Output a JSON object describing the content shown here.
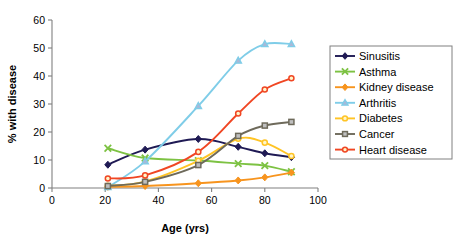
{
  "chart_data": {
    "type": "line",
    "title": "",
    "xlabel": "Age (yrs)",
    "ylabel": "% with disease",
    "xlim": [
      0,
      100
    ],
    "ylim": [
      0,
      60
    ],
    "xticks": [
      0,
      20,
      40,
      60,
      80,
      100
    ],
    "yticks": [
      0,
      10,
      20,
      30,
      40,
      50,
      60
    ],
    "grid": false,
    "legend_position": "right",
    "x": [
      21,
      35,
      55,
      70,
      80,
      90
    ],
    "series": [
      {
        "name": "Sinusitis",
        "color": "#1F1A54",
        "marker": "diamond",
        "values": [
          8.3,
          13.7,
          17.5,
          14.7,
          12.4,
          11.0
        ]
      },
      {
        "name": "Asthma",
        "color": "#7DC243",
        "marker": "cross",
        "values": [
          14.2,
          10.7,
          9.8,
          8.7,
          8.0,
          5.8
        ]
      },
      {
        "name": "Kidney disease",
        "color": "#F7941E",
        "marker": "diamond",
        "values": [
          0.4,
          0.7,
          1.7,
          2.7,
          3.8,
          5.5
        ]
      },
      {
        "name": "Arthritis",
        "color": "#7FCDE8",
        "marker": "triangle",
        "values": [
          0.3,
          9.5,
          29.3,
          45.5,
          51.4,
          51.4
        ]
      },
      {
        "name": "Diabetes",
        "color": "#FFC425",
        "marker": "circle",
        "values": [
          0.8,
          2.3,
          9.7,
          17.6,
          16.2,
          11.4
        ]
      },
      {
        "name": "Cancer",
        "color": "#6E6A5B",
        "marker": "square",
        "values": [
          0.7,
          2.2,
          8.2,
          18.6,
          22.3,
          23.6
        ]
      },
      {
        "name": "Heart disease",
        "color": "#F04623",
        "marker": "circle",
        "values": [
          3.4,
          4.5,
          12.9,
          26.6,
          35.2,
          39.2
        ]
      }
    ]
  },
  "legend": {
    "entries": [
      {
        "label": "Sinusitis"
      },
      {
        "label": "Asthma"
      },
      {
        "label": "Kidney disease"
      },
      {
        "label": "Arthritis"
      },
      {
        "label": "Diabetes"
      },
      {
        "label": "Cancer"
      },
      {
        "label": "Heart disease"
      }
    ]
  },
  "axes": {
    "x_tick_labels": [
      "0",
      "20",
      "40",
      "60",
      "80",
      "100"
    ],
    "y_tick_labels": [
      "0",
      "10",
      "20",
      "30",
      "40",
      "50",
      "60"
    ],
    "x_title": "Age (yrs)",
    "y_title": "% with disease"
  }
}
